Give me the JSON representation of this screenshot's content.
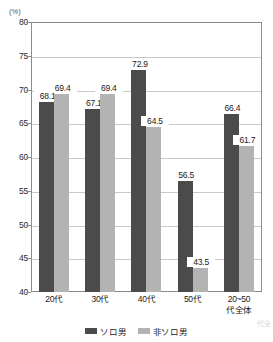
{
  "chart_data": {
    "type": "bar",
    "title": "",
    "subtitle": "",
    "xlabel": "",
    "ylabel": "",
    "unit_label": "(%)",
    "ylim": [
      40,
      80
    ],
    "yticks": [
      40,
      45,
      50,
      55,
      60,
      65,
      70,
      75,
      80
    ],
    "grid": true,
    "legend_position": "bottom-center",
    "categories": [
      "20代",
      "30代",
      "40~50代",
      "50代",
      "20~50代全体"
    ],
    "category_labels": [
      [
        "20代"
      ],
      [
        "30代"
      ],
      [
        "40代"
      ],
      [
        "50代"
      ],
      [
        "20~50",
        "代全体"
      ]
    ],
    "series": [
      {
        "name": "ソロ男",
        "color": "#4b4b4b",
        "values": [
          68.1,
          67.1,
          72.9,
          56.5,
          66.4
        ]
      },
      {
        "name": "非ソロ男",
        "color": "#b3b3b3",
        "values": [
          69.4,
          69.4,
          64.5,
          43.5,
          61.7
        ]
      }
    ],
    "value_labels": [
      [
        "68.1",
        "67.1",
        "72.9",
        "56.5",
        "66.4"
      ],
      [
        "69.4",
        "69.4",
        "64.5",
        "43.5",
        "61.7"
      ]
    ]
  },
  "axis": {
    "unit": "(%)",
    "tick_labels": [
      "80",
      "75",
      "70",
      "65",
      "60",
      "55",
      "50",
      "45",
      "40"
    ]
  },
  "legend": {
    "items": [
      {
        "label": "ソロ男"
      },
      {
        "label": "非ソロ男"
      }
    ]
  },
  "bleed": {
    "top": "",
    "right": "代全"
  }
}
